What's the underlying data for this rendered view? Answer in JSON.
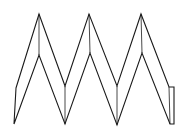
{
  "diagram": {
    "type": "line-drawing",
    "stroke_color": "#1a1a1a",
    "background": "#ffffff",
    "outer_outline": [
      [
        16,
        88
      ],
      [
        39,
        14
      ],
      [
        65,
        86
      ],
      [
        89,
        14
      ],
      [
        117,
        86
      ],
      [
        141,
        14
      ],
      [
        169,
        87
      ],
      [
        174,
        87
      ],
      [
        174,
        124
      ],
      [
        170,
        124
      ],
      [
        142,
        53
      ],
      [
        117,
        125
      ],
      [
        90,
        53
      ],
      [
        65,
        124
      ],
      [
        39,
        55
      ],
      [
        14,
        124
      ],
      [
        16,
        88
      ]
    ],
    "creases": [
      [
        [
          39,
          14
        ],
        [
          39,
          55
        ]
      ],
      [
        [
          89,
          14
        ],
        [
          90,
          53
        ]
      ],
      [
        [
          141,
          14
        ],
        [
          142,
          53
        ]
      ],
      [
        [
          65,
          86
        ],
        [
          65,
          124
        ]
      ],
      [
        [
          117,
          86
        ],
        [
          117,
          125
        ]
      ],
      [
        [
          169,
          87
        ],
        [
          170,
          124
        ]
      ]
    ]
  }
}
